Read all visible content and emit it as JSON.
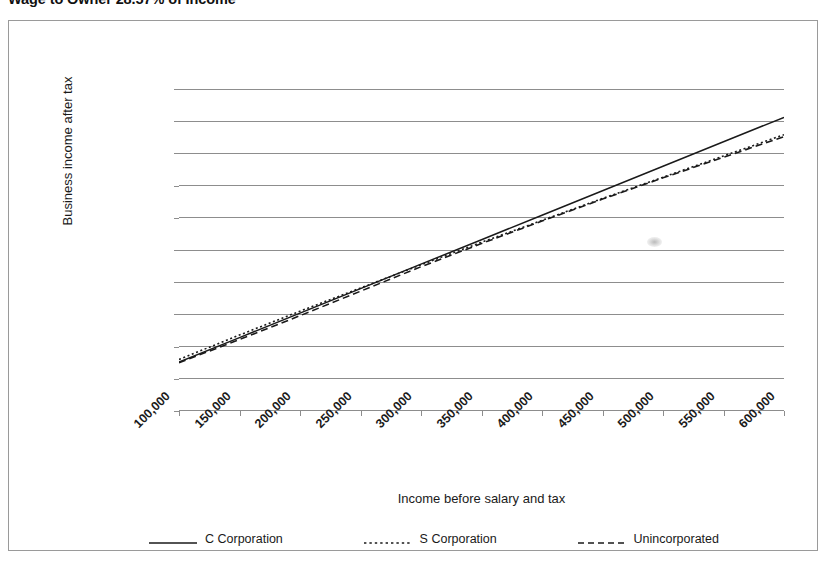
{
  "title": "Wage to Owner 28.57% of Income",
  "frame": {
    "border_color": "#9a9a9a"
  },
  "legend": {
    "position": "bottom",
    "entries": [
      {
        "label": "C Corporation",
        "style": "solid",
        "color": "#1a1a1a"
      },
      {
        "label": "S Corporation",
        "style": "dotted",
        "color": "#1a1a1a"
      },
      {
        "label": "Unincorporated",
        "style": "dashed",
        "color": "#1a1a1a"
      }
    ]
  },
  "chart_data": {
    "type": "line",
    "title": "Wage to Owner 28.57% of Income",
    "xlabel": "Income before salary and tax",
    "ylabel": "Business income after tax",
    "categories": [
      "100,000",
      "150,000",
      "200,000",
      "250,000",
      "300,000",
      "350,000",
      "400,000",
      "450,000",
      "500,000",
      "550,000",
      "600,000"
    ],
    "x": [
      100000,
      150000,
      200000,
      250000,
      300000,
      350000,
      400000,
      450000,
      500000,
      550000,
      600000
    ],
    "xlim": [
      100000,
      600000
    ],
    "ylim": [
      0,
      500000
    ],
    "ytick_labels": [
      "0",
      "50,000",
      "100,000",
      "150,000",
      "200,000",
      "250,000",
      "300,000",
      "350,000",
      "400,000",
      "450,000",
      "500,000"
    ],
    "yticks": [
      0,
      50000,
      100000,
      150000,
      200000,
      250000,
      300000,
      350000,
      400000,
      450000,
      500000
    ],
    "grid": "horizontal",
    "legend_position": "bottom",
    "series": [
      {
        "name": "C Corporation",
        "style": "solid",
        "color": "#1a1a1a",
        "values": [
          76000,
          114000,
          152000,
          190000,
          228000,
          266000,
          304000,
          342000,
          380000,
          418000,
          456000
        ]
      },
      {
        "name": "S Corporation",
        "style": "dotted",
        "color": "#1a1a1a",
        "values": [
          80000,
          118000,
          155000,
          191000,
          227000,
          262000,
          296000,
          330000,
          363000,
          396000,
          429000
        ]
      },
      {
        "name": "Unincorporated",
        "style": "dashed",
        "color": "#1a1a1a",
        "values": [
          75000,
          111000,
          148000,
          186000,
          224000,
          260000,
          295000,
          329000,
          362000,
          394000,
          426000
        ]
      }
    ]
  }
}
